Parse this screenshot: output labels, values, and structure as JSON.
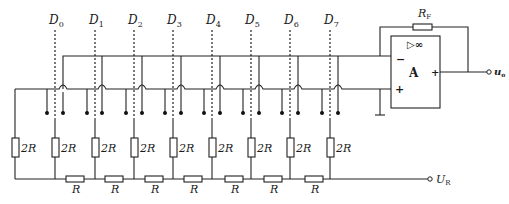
{
  "diagram": {
    "bits": [
      {
        "label": "D",
        "sub": "0",
        "x": 55
      },
      {
        "label": "D",
        "sub": "1",
        "x": 95
      },
      {
        "label": "D",
        "sub": "2",
        "x": 134
      },
      {
        "label": "D",
        "sub": "3",
        "x": 173
      },
      {
        "label": "D",
        "sub": "4",
        "x": 212
      },
      {
        "label": "D",
        "sub": "5",
        "x": 251
      },
      {
        "label": "D",
        "sub": "6",
        "x": 290
      },
      {
        "label": "D",
        "sub": "7",
        "x": 330
      }
    ],
    "shunt_resistors": [
      {
        "label": "2R"
      },
      {
        "label": "2R"
      },
      {
        "label": "2R"
      },
      {
        "label": "2R"
      },
      {
        "label": "2R"
      },
      {
        "label": "2R"
      },
      {
        "label": "2R"
      },
      {
        "label": "2R"
      },
      {
        "label": "2R"
      }
    ],
    "series_resistors": [
      {
        "label": "R"
      },
      {
        "label": "R"
      },
      {
        "label": "R"
      },
      {
        "label": "R"
      },
      {
        "label": "R"
      },
      {
        "label": "R"
      },
      {
        "label": "R"
      }
    ],
    "op_amp": {
      "label": "A",
      "gain_symbol": "▷∞",
      "inverting": "−",
      "non_inverting": "+",
      "output_sign": "+"
    },
    "feedback_resistor": {
      "label": "R",
      "sub": "F"
    },
    "output": {
      "label": "u",
      "sub": "o"
    },
    "reference": {
      "label": "U",
      "sub": "R"
    }
  }
}
